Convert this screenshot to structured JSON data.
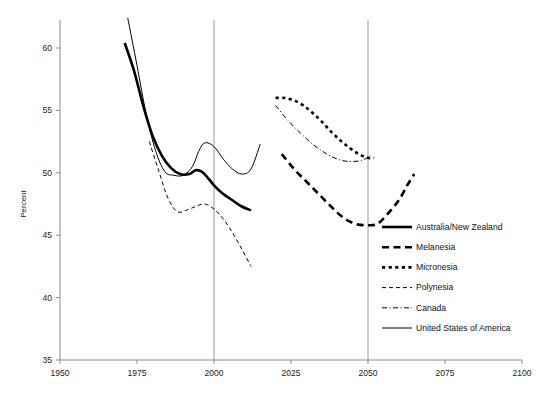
{
  "chart_data": {
    "type": "line",
    "title": "",
    "subtitle": "",
    "xlabel": "",
    "ylabel": "Percent",
    "xlim": [
      1950,
      2100
    ],
    "ylim": [
      35,
      62.5
    ],
    "xticks": [
      1950,
      1975,
      2000,
      2025,
      2050,
      2075,
      2100
    ],
    "xtick_labels": [
      "1950",
      "1975",
      "2000",
      "2025",
      "2050",
      "2075",
      "2100"
    ],
    "yticks": [
      35,
      40,
      45,
      50,
      55,
      60
    ],
    "ytick_labels": [
      "35",
      "40",
      "45",
      "50",
      "55",
      "60"
    ],
    "grid": false,
    "reference_lines_x": [
      2000,
      2050
    ],
    "legend_position": "right-inside",
    "series": [
      {
        "name": "Australia/New Zealand",
        "style": "solid",
        "width": 2.6,
        "color": "#000000",
        "x": [
          1971,
          1974,
          1977,
          1980,
          1983,
          1986,
          1989,
          1992,
          1994,
          1996,
          1998,
          2000,
          2003,
          2006,
          2009,
          2012
        ],
        "y": [
          60.4,
          58.2,
          55.4,
          53.0,
          51.4,
          50.4,
          49.9,
          49.9,
          50.2,
          50.1,
          49.6,
          49.0,
          48.3,
          47.8,
          47.3,
          47.0
        ]
      },
      {
        "name": "Melanesia",
        "style": "dashed",
        "width": 2.6,
        "color": "#000000",
        "x": [
          2022,
          2026,
          2030,
          2034,
          2038,
          2042,
          2046,
          2050,
          2053,
          2056,
          2060,
          2063,
          2065
        ],
        "y": [
          51.5,
          50.3,
          49.3,
          48.3,
          47.3,
          46.4,
          45.9,
          45.8,
          45.9,
          46.6,
          47.8,
          49.1,
          49.9
        ]
      },
      {
        "name": "Micronesia",
        "style": "dotted",
        "width": 2.6,
        "color": "#000000",
        "x": [
          2020,
          2023,
          2026,
          2029,
          2032,
          2035,
          2038,
          2041,
          2044,
          2047,
          2050,
          2052
        ],
        "y": [
          56.0,
          56.0,
          55.8,
          55.4,
          54.8,
          54.1,
          53.3,
          52.6,
          52.0,
          51.5,
          51.2,
          51.2
        ]
      },
      {
        "name": "Polynesia",
        "style": "dashed-thin",
        "width": 1.0,
        "color": "#000000",
        "x": [
          1979,
          1982,
          1985,
          1988,
          1991,
          1994,
          1997,
          2000,
          2003,
          2006,
          2009,
          2012
        ],
        "y": [
          52.5,
          50.2,
          48.0,
          46.9,
          47.0,
          47.3,
          47.5,
          47.1,
          46.3,
          45.2,
          43.9,
          42.5
        ]
      },
      {
        "name": "Canada",
        "style": "dash-dot",
        "width": 1.0,
        "color": "#000000",
        "x": [
          2020,
          2024,
          2028,
          2032,
          2036,
          2040,
          2044,
          2048,
          2051
        ],
        "y": [
          55.4,
          54.2,
          53.2,
          52.3,
          51.6,
          51.1,
          50.9,
          51.0,
          51.4
        ]
      },
      {
        "name": "United States of America",
        "style": "solid-thin",
        "width": 1.0,
        "color": "#000000",
        "x": [
          1972,
          1975,
          1978,
          1981,
          1984,
          1987,
          1990,
          1993,
          1995,
          1997,
          2000,
          2003,
          2006,
          2009,
          2012,
          2015
        ],
        "y": [
          62.4,
          58.6,
          54.7,
          51.8,
          50.1,
          49.8,
          49.8,
          50.5,
          51.7,
          52.4,
          52.1,
          51.1,
          50.3,
          49.9,
          50.3,
          52.3
        ]
      }
    ],
    "legend_entries": [
      "Australia/New Zealand",
      "Melanesia",
      "Micronesia",
      "Polynesia",
      "Canada",
      "United States of America"
    ]
  }
}
